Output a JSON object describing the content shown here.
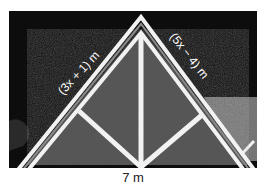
{
  "figure": {
    "labels": {
      "left_side": "(3x + 1) m",
      "right_side": "(5x − 4) m",
      "base": "7 m"
    },
    "colors": {
      "sky": "#0d0d0d",
      "roof_fill": "#5a5a5a",
      "trim": "#f2f2f2",
      "background_roof": "#7a7a7a"
    }
  }
}
